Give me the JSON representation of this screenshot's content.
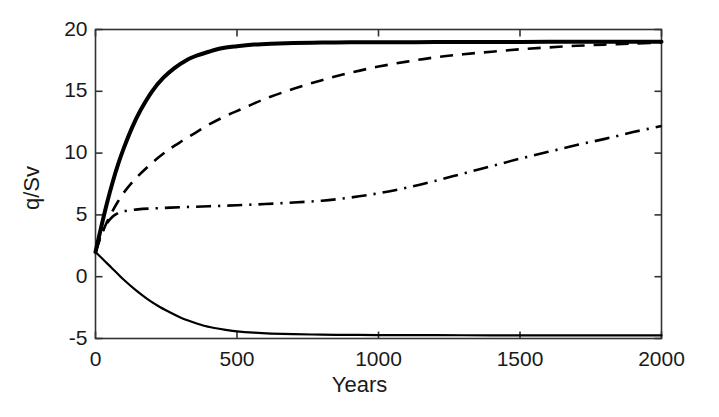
{
  "chart_data": {
    "type": "line",
    "title": "",
    "xlabel": "Years",
    "ylabel": "q/Sv",
    "xlim": [
      0,
      2000
    ],
    "ylim": [
      -5,
      20
    ],
    "xticks": [
      0,
      500,
      1000,
      1500,
      2000
    ],
    "xtick_labels": [
      "0",
      "500",
      "1000",
      "1500",
      "2000"
    ],
    "yticks": [
      -5,
      0,
      5,
      10,
      15,
      20
    ],
    "ytick_labels": [
      "-5",
      "0",
      "5",
      "10",
      "15",
      "20"
    ],
    "grid": false,
    "legend": "none",
    "series": [
      {
        "name": "thick-solid",
        "style": "solid",
        "linewidth": 4,
        "color": "#000000",
        "x": [
          0,
          20,
          40,
          60,
          80,
          100,
          130,
          160,
          200,
          240,
          280,
          320,
          360,
          400,
          450,
          500,
          560,
          620,
          700,
          800,
          900,
          1000,
          1200,
          1400,
          1600,
          1800,
          2000
        ],
        "y": [
          2.0,
          4.0,
          5.9,
          7.6,
          9.1,
          10.4,
          12.1,
          13.5,
          15.0,
          16.1,
          16.9,
          17.5,
          17.9,
          18.2,
          18.5,
          18.65,
          18.78,
          18.85,
          18.9,
          18.94,
          18.96,
          18.97,
          18.98,
          18.99,
          19.0,
          19.0,
          19.0
        ]
      },
      {
        "name": "dashed",
        "style": "dashed",
        "linewidth": 2.6,
        "color": "#000000",
        "x": [
          0,
          20,
          40,
          60,
          80,
          100,
          140,
          180,
          220,
          260,
          300,
          350,
          400,
          460,
          520,
          600,
          700,
          800,
          900,
          1000,
          1100,
          1200,
          1300,
          1400,
          1500,
          1600,
          1700,
          1800,
          1900,
          2000
        ],
        "y": [
          2.0,
          3.3,
          4.4,
          5.3,
          6.1,
          6.8,
          7.9,
          8.8,
          9.6,
          10.3,
          10.9,
          11.6,
          12.3,
          13.0,
          13.6,
          14.4,
          15.2,
          15.9,
          16.5,
          17.0,
          17.4,
          17.75,
          18.0,
          18.2,
          18.4,
          18.55,
          18.68,
          18.78,
          18.86,
          18.93
        ]
      },
      {
        "name": "dash-dot",
        "style": "dashdot",
        "linewidth": 2.6,
        "color": "#000000",
        "x": [
          0,
          20,
          40,
          60,
          80,
          100,
          150,
          200,
          300,
          400,
          500,
          600,
          700,
          800,
          900,
          1000,
          1100,
          1200,
          1300,
          1400,
          1500,
          1600,
          1700,
          1800,
          1900,
          2000
        ],
        "y": [
          2.0,
          3.4,
          4.3,
          4.85,
          5.15,
          5.3,
          5.45,
          5.52,
          5.62,
          5.7,
          5.78,
          5.88,
          6.0,
          6.15,
          6.4,
          6.75,
          7.2,
          7.75,
          8.35,
          8.95,
          9.55,
          10.1,
          10.65,
          11.15,
          11.7,
          12.2
        ]
      },
      {
        "name": "thin-solid",
        "style": "solid",
        "linewidth": 2.2,
        "color": "#000000",
        "x": [
          0,
          20,
          40,
          60,
          80,
          100,
          140,
          180,
          220,
          260,
          300,
          340,
          380,
          420,
          460,
          500,
          560,
          620,
          700,
          800,
          900,
          1000,
          1200,
          1400,
          1600,
          1800,
          2000
        ],
        "y": [
          2.0,
          1.55,
          1.1,
          0.65,
          0.2,
          -0.25,
          -1.05,
          -1.75,
          -2.35,
          -2.85,
          -3.3,
          -3.65,
          -3.95,
          -4.15,
          -4.3,
          -4.42,
          -4.53,
          -4.6,
          -4.65,
          -4.69,
          -4.71,
          -4.72,
          -4.73,
          -4.74,
          -4.74,
          -4.75,
          -4.75
        ]
      }
    ]
  },
  "axes": {
    "frame_color": "#333333",
    "frame_width": 1.6
  }
}
